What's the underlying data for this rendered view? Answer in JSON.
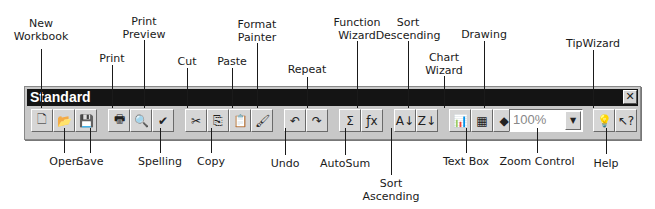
{
  "toolbar": {
    "title": "Standard",
    "close_glyph": "✕",
    "zoom_value": "100%",
    "buttons": [
      {
        "name": "new-workbook",
        "glyph": "🗋",
        "x": 6
      },
      {
        "name": "open",
        "glyph": "📂",
        "x": 28
      },
      {
        "name": "save",
        "glyph": "💾",
        "x": 50
      },
      {
        "name": "print",
        "glyph": "🖶",
        "x": 83
      },
      {
        "name": "print-preview",
        "glyph": "🔍",
        "x": 105
      },
      {
        "name": "spelling",
        "glyph": "✔",
        "x": 127
      },
      {
        "name": "cut",
        "glyph": "✂",
        "x": 160
      },
      {
        "name": "copy",
        "glyph": "⎘",
        "x": 182
      },
      {
        "name": "paste",
        "glyph": "📋",
        "x": 204
      },
      {
        "name": "format-painter",
        "glyph": "🖌",
        "x": 226
      },
      {
        "name": "undo",
        "glyph": "↶",
        "x": 259
      },
      {
        "name": "repeat",
        "glyph": "↷",
        "x": 281
      },
      {
        "name": "autosum",
        "glyph": "Σ",
        "x": 314
      },
      {
        "name": "function-wizard",
        "glyph": "ƒx",
        "x": 336
      },
      {
        "name": "sort-ascending",
        "glyph": "A↓",
        "x": 369
      },
      {
        "name": "sort-descending",
        "glyph": "Z↓",
        "x": 391
      },
      {
        "name": "chart-wizard",
        "glyph": "📊",
        "x": 424
      },
      {
        "name": "text-box",
        "glyph": "▦",
        "x": 446
      },
      {
        "name": "drawing",
        "glyph": "◆",
        "x": 468
      },
      {
        "name": "tipwizard",
        "glyph": "💡",
        "x": 568
      },
      {
        "name": "help",
        "glyph": "↖?",
        "x": 590
      }
    ]
  },
  "callouts_top": [
    {
      "label": "New\nWorkbook",
      "x": 41,
      "y": 17,
      "line_top": 49,
      "line_bottom": 108
    },
    {
      "label": "Print",
      "x": 112,
      "y": 52,
      "line_top": 65,
      "line_bottom": 108
    },
    {
      "label": "Print\nPreview",
      "x": 144,
      "y": 15,
      "line_top": 40,
      "line_bottom": 108
    },
    {
      "label": "Cut",
      "x": 187,
      "y": 55,
      "line_top": 68,
      "line_bottom": 108
    },
    {
      "label": "Paste",
      "x": 232,
      "y": 55,
      "line_top": 68,
      "line_bottom": 108
    },
    {
      "label": "Format\nPainter",
      "x": 257,
      "y": 18,
      "line_top": 43,
      "line_bottom": 108
    },
    {
      "label": "Repeat",
      "x": 307,
      "y": 63,
      "line_top": 77,
      "line_bottom": 108
    },
    {
      "label": "Function\nWizard",
      "x": 357,
      "y": 16,
      "line_top": 41,
      "line_bottom": 108
    },
    {
      "label": "Sort\nDescending",
      "x": 408,
      "y": 16,
      "line_top": 41,
      "line_bottom": 108
    },
    {
      "label": "Chart\nWizard",
      "x": 444,
      "y": 51,
      "line_top": 76,
      "line_bottom": 108
    },
    {
      "label": "Drawing",
      "x": 484,
      "y": 28,
      "line_top": 41,
      "line_bottom": 108
    },
    {
      "label": "TipWizard",
      "x": 593,
      "y": 37,
      "line_top": 50,
      "line_bottom": 108
    }
  ],
  "callouts_bottom": [
    {
      "label": "Open",
      "x": 64,
      "y": 155,
      "line_top": 128,
      "line_bottom": 153
    },
    {
      "label": "Save",
      "x": 90,
      "y": 155,
      "line_top": 128,
      "line_bottom": 153
    },
    {
      "label": "Spelling",
      "x": 160,
      "y": 155,
      "line_top": 128,
      "line_bottom": 153
    },
    {
      "label": "Copy",
      "x": 211,
      "y": 155,
      "line_top": 128,
      "line_bottom": 153
    },
    {
      "label": "Undo",
      "x": 285,
      "y": 157,
      "line_top": 128,
      "line_bottom": 155
    },
    {
      "label": "AutoSum",
      "x": 345,
      "y": 157,
      "line_top": 128,
      "line_bottom": 155
    },
    {
      "label": "Sort\nAscending",
      "x": 391,
      "y": 177,
      "line_top": 128,
      "line_bottom": 175
    },
    {
      "label": "Text Box",
      "x": 466,
      "y": 155,
      "line_top": 128,
      "line_bottom": 153
    },
    {
      "label": "Zoom Control",
      "x": 537,
      "y": 155,
      "line_top": 128,
      "line_bottom": 153
    },
    {
      "label": "Help",
      "x": 606,
      "y": 157,
      "line_top": 128,
      "line_bottom": 154
    }
  ]
}
